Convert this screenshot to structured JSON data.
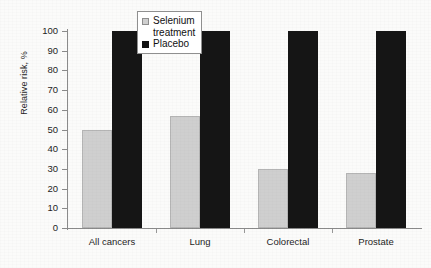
{
  "chart_data": {
    "type": "bar",
    "title": "",
    "xlabel": "",
    "ylabel": "Relative risk, %",
    "ylim": [
      0,
      100
    ],
    "yticks": [
      0,
      10,
      20,
      30,
      40,
      50,
      60,
      70,
      80,
      90,
      100
    ],
    "ytick_labels": [
      "0",
      "10",
      "20",
      "30",
      "40",
      "50",
      "60",
      "70",
      "80",
      "90",
      "100"
    ],
    "grid": false,
    "legend_position": "top-center-left",
    "categories": [
      "All cancers",
      "Lung",
      "Colorectal",
      "Prostate"
    ],
    "series": [
      {
        "name": "Selenium treatment",
        "color": "#cfcfcf",
        "values": [
          50,
          57,
          30,
          28
        ]
      },
      {
        "name": "Placebo",
        "color": "#151515",
        "values": [
          100,
          100,
          100,
          100
        ]
      }
    ]
  },
  "legend": {
    "entries": [
      {
        "label": "Selenium\ntreatment",
        "swatch": "selenium-swatch"
      },
      {
        "label": "Placebo",
        "swatch": "placebo-swatch"
      }
    ]
  }
}
